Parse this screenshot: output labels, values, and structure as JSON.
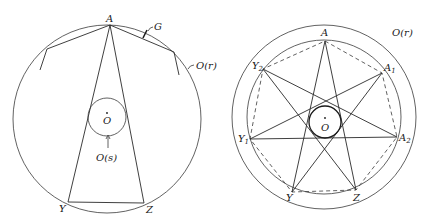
{
  "left_figure": {
    "labels": {
      "vertex_top": "A",
      "vertex_bottom_left": "Y",
      "vertex_bottom_right": "Z",
      "arc_marker": "G",
      "circumcircle": "O(r)",
      "incircle": "O(s)",
      "center": "O"
    }
  },
  "right_figure": {
    "labels": {
      "outer_circle": "O(r)",
      "center": "O",
      "A": "A",
      "A1": "A",
      "A1_sub": "1",
      "A2": "A",
      "A2_sub": "2",
      "Z": "Z",
      "Y": "Y",
      "Y1": "Y",
      "Y1_sub": "1",
      "Y2": "Y",
      "Y2_sub": "2"
    }
  }
}
